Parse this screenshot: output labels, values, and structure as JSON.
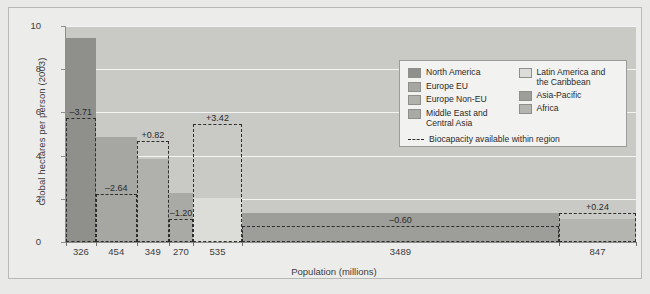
{
  "chart_data": {
    "type": "bar",
    "title": "",
    "subtitle": "",
    "xlabel": "Population (millions)",
    "ylabel": "Global hectares per person (2003)",
    "ylim": [
      0,
      10
    ],
    "yticks": [
      0,
      2,
      4,
      6,
      8,
      10
    ],
    "grid": true,
    "legend_position": "upper-right",
    "note": "Bar width is proportional to population; bar height is the ecological footprint per person. Dashed rectangles show biocapacity available within the region. Labels give biocapacity minus footprint.",
    "categories": [
      "North America",
      "Europe EU",
      "Europe Non-EU",
      "Middle East and Central Asia",
      "Latin America and the Caribbean",
      "Asia-Pacific",
      "Africa"
    ],
    "population_millions": [
      326,
      454,
      349,
      270,
      535,
      3489,
      847
    ],
    "series": [
      {
        "name": "Ecological footprint",
        "values": [
          9.45,
          4.85,
          3.85,
          2.25,
          2.05,
          1.35,
          1.08
        ]
      },
      {
        "name": "Biocapacity available within region",
        "values": [
          5.74,
          2.21,
          4.67,
          1.05,
          5.47,
          0.75,
          1.32
        ]
      }
    ],
    "difference_labels": [
      "–3.71",
      "–2.64",
      "+0.82",
      "–1.20",
      "+3.42",
      "–0.60",
      "+0.24"
    ],
    "xtick_labels": [
      "326",
      "454",
      "349",
      "270",
      "535",
      "3489",
      "847"
    ],
    "colors": {
      "north_america": "#8f8f8c",
      "europe_eu": "#a6a6a3",
      "europe_non_eu": "#b0b0ad",
      "middle_east_central_asia": "#a9a9a6",
      "latin_america_caribbean": "#dcdcd9",
      "asia_pacific": "#9d9d9a",
      "africa": "#b4b4b1",
      "plot_background": "#c9c9c6",
      "figure_background": "#ececeb",
      "gridline": "#f4f4f2",
      "biocapacity_outline": "#2d2d2d"
    }
  },
  "axes": {
    "y_title": "Global hectares per person (2003)",
    "x_title": "Population (millions)",
    "y_ticks": [
      "10",
      "8",
      "6",
      "4",
      "2",
      "0"
    ]
  },
  "legend": {
    "column_left": [
      {
        "label": "North America",
        "color": "#8f8f8c"
      },
      {
        "label": "Europe EU",
        "color": "#a6a6a3"
      },
      {
        "label": "Europe Non-EU",
        "color": "#b0b0ad"
      },
      {
        "label": "Middle East and Central Asia",
        "color": "#a9a9a6"
      }
    ],
    "column_right": [
      {
        "label": "Latin America and the Caribbean",
        "color": "#dcdcd9"
      },
      {
        "label": "Asia-Pacific",
        "color": "#9d9d9a"
      },
      {
        "label": "Africa",
        "color": "#b4b4b1"
      }
    ],
    "biocapacity_label": "Biocapacity available within region"
  }
}
